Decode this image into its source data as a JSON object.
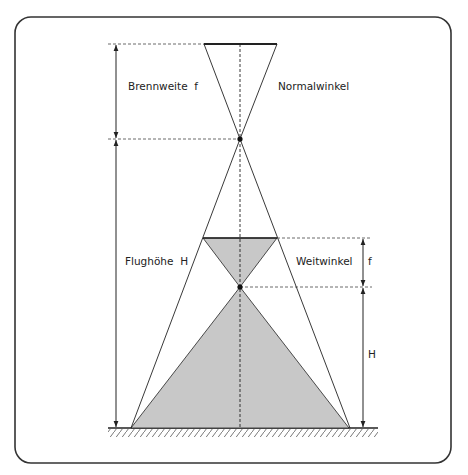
{
  "diagram": {
    "labels": {
      "focal_length": "Brennweite  f",
      "normal_angle": "Normalwinkel",
      "flight_height": "Flughöhe  H",
      "wide_angle": "Weitwinkel",
      "f_short": "f",
      "h_short": "H"
    },
    "colors": {
      "frame": "#333333",
      "line": "#222222",
      "fill": "#c8c8c8"
    }
  }
}
